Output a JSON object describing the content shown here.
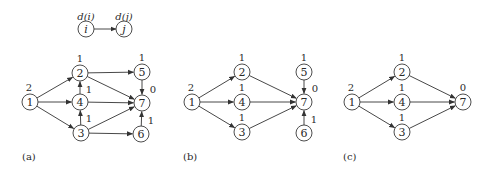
{
  "legend": {
    "from_node": {
      "label": "i",
      "dist": "d(i)",
      "x": 86,
      "y": 29
    },
    "to_node": {
      "label": "j",
      "dist": "d(j)",
      "x": 124,
      "y": 29
    }
  },
  "graphs": [
    {
      "panel_label": "(a)",
      "label_pos": {
        "x": 22,
        "y": 156
      },
      "nodes": [
        {
          "id": "1",
          "x": 30,
          "y": 102,
          "dist": "2",
          "dx": -1,
          "dy": -15
        },
        {
          "id": "2",
          "x": 80,
          "y": 73,
          "dist": "1",
          "dx": 0,
          "dy": -15
        },
        {
          "id": "4",
          "x": 80,
          "y": 102,
          "dist": "1",
          "dx": 9,
          "dy": -13
        },
        {
          "id": "3",
          "x": 81,
          "y": 133,
          "dist": "1",
          "dx": 8,
          "dy": -15
        },
        {
          "id": "5",
          "x": 142,
          "y": 72,
          "dist": "1",
          "dx": 0,
          "dy": -15
        },
        {
          "id": "7",
          "x": 142,
          "y": 103,
          "dist": "0",
          "dx": 11,
          "dy": -14
        },
        {
          "id": "6",
          "x": 141,
          "y": 134,
          "dist": "1",
          "dx": 10,
          "dy": -14
        }
      ],
      "edges": [
        [
          "1",
          "2"
        ],
        [
          "1",
          "4"
        ],
        [
          "1",
          "3"
        ],
        [
          "2",
          "5"
        ],
        [
          "2",
          "7"
        ],
        [
          "4",
          "2"
        ],
        [
          "4",
          "7"
        ],
        [
          "3",
          "4"
        ],
        [
          "3",
          "7"
        ],
        [
          "3",
          "6"
        ],
        [
          "5",
          "7"
        ],
        [
          "6",
          "7"
        ]
      ]
    },
    {
      "panel_label": "(b)",
      "label_pos": {
        "x": 183,
        "y": 156
      },
      "nodes": [
        {
          "id": "1",
          "x": 192,
          "y": 102,
          "dist": "2",
          "dx": -1,
          "dy": -15
        },
        {
          "id": "2",
          "x": 242,
          "y": 72,
          "dist": "1",
          "dx": 0,
          "dy": -15
        },
        {
          "id": "4",
          "x": 242,
          "y": 102,
          "dist": "1",
          "dx": 0,
          "dy": -15
        },
        {
          "id": "3",
          "x": 242,
          "y": 132,
          "dist": "1",
          "dx": 0,
          "dy": -15
        },
        {
          "id": "5",
          "x": 304,
          "y": 72,
          "dist": "1",
          "dx": 0,
          "dy": -15
        },
        {
          "id": "7",
          "x": 304,
          "y": 102,
          "dist": "0",
          "dx": 11,
          "dy": -14
        },
        {
          "id": "6",
          "x": 304,
          "y": 133,
          "dist": "1",
          "dx": 10,
          "dy": -14
        }
      ],
      "edges": [
        [
          "1",
          "2"
        ],
        [
          "1",
          "4"
        ],
        [
          "1",
          "3"
        ],
        [
          "2",
          "7"
        ],
        [
          "4",
          "7"
        ],
        [
          "3",
          "7"
        ],
        [
          "5",
          "7"
        ],
        [
          "6",
          "7"
        ]
      ]
    },
    {
      "panel_label": "(c)",
      "label_pos": {
        "x": 343,
        "y": 156
      },
      "nodes": [
        {
          "id": "1",
          "x": 352,
          "y": 102,
          "dist": "2",
          "dx": -1,
          "dy": -15
        },
        {
          "id": "2",
          "x": 402,
          "y": 72,
          "dist": "1",
          "dx": 0,
          "dy": -15
        },
        {
          "id": "4",
          "x": 402,
          "y": 102,
          "dist": "1",
          "dx": 0,
          "dy": -15
        },
        {
          "id": "3",
          "x": 402,
          "y": 132,
          "dist": "1",
          "dx": 0,
          "dy": -15
        },
        {
          "id": "7",
          "x": 463,
          "y": 102,
          "dist": "0",
          "dx": 0,
          "dy": -15
        }
      ],
      "edges": [
        [
          "1",
          "2"
        ],
        [
          "1",
          "4"
        ],
        [
          "1",
          "3"
        ],
        [
          "2",
          "7"
        ],
        [
          "4",
          "7"
        ],
        [
          "3",
          "7"
        ]
      ]
    }
  ],
  "style": {
    "node_radius": 8,
    "stroke_color": "#333333",
    "text_color": "#2a2a2a",
    "background": "#ffffff"
  }
}
